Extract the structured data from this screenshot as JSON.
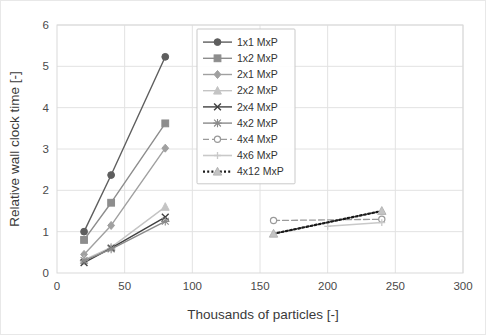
{
  "figure": {
    "background": "#ffffff",
    "border_color": "#e8e8e8"
  },
  "chart_data": {
    "type": "line",
    "title": "",
    "xlabel": "Thousands of particles [-]",
    "ylabel": "Relative wall clock time [-]",
    "xlim": [
      0,
      300
    ],
    "ylim": [
      0,
      6
    ],
    "xticks": [
      0,
      50,
      100,
      150,
      200,
      250,
      300
    ],
    "yticks": [
      0,
      1,
      2,
      3,
      4,
      5,
      6
    ],
    "grid": true,
    "legend_position": "upper-center",
    "series": [
      {
        "name": "1x1 MxP",
        "color": "#5e5e5e",
        "marker": "circle",
        "dash": "none",
        "width": 1.4,
        "x": [
          20,
          40,
          80
        ],
        "y": [
          1.0,
          2.37,
          5.23
        ]
      },
      {
        "name": "1x2 MxP",
        "color": "#8d8d8d",
        "marker": "square",
        "dash": "none",
        "width": 1.4,
        "x": [
          20,
          40,
          80
        ],
        "y": [
          0.8,
          1.7,
          3.62
        ]
      },
      {
        "name": "2x1 MxP",
        "color": "#a0a0a0",
        "marker": "diamond",
        "dash": "none",
        "width": 1.4,
        "x": [
          20,
          40,
          80
        ],
        "y": [
          0.45,
          1.15,
          3.02
        ]
      },
      {
        "name": "2x2 MxP",
        "color": "#c4c4c4",
        "marker": "triangle",
        "dash": "none",
        "width": 1.4,
        "x": [
          20,
          40,
          80
        ],
        "y": [
          0.32,
          0.62,
          1.6
        ]
      },
      {
        "name": "2x4 MxP",
        "color": "#404040",
        "marker": "x",
        "dash": "none",
        "width": 1.4,
        "x": [
          20,
          40,
          80
        ],
        "y": [
          0.25,
          0.6,
          1.35
        ]
      },
      {
        "name": "4x2 MxP",
        "color": "#8a8a8a",
        "marker": "star",
        "dash": "none",
        "width": 1.4,
        "x": [
          20,
          40,
          80
        ],
        "y": [
          0.3,
          0.58,
          1.25
        ]
      },
      {
        "name": "4x4 MxP",
        "color": "#9a9a9a",
        "marker": "circle-open",
        "dash": "dashed",
        "width": 1.3,
        "x": [
          160,
          240
        ],
        "y": [
          1.27,
          1.3
        ]
      },
      {
        "name": "4x6 MxP",
        "color": "#c9c9c9",
        "marker": "plus",
        "dash": "none",
        "width": 1.6,
        "x": [
          200,
          240
        ],
        "y": [
          1.13,
          1.22
        ]
      },
      {
        "name": "4x12 MxP",
        "color": "#1a1a1a",
        "marker": "triangle-light",
        "dash": "dotted",
        "width": 2.2,
        "x": [
          160,
          240
        ],
        "y": [
          0.95,
          1.5
        ]
      }
    ]
  }
}
